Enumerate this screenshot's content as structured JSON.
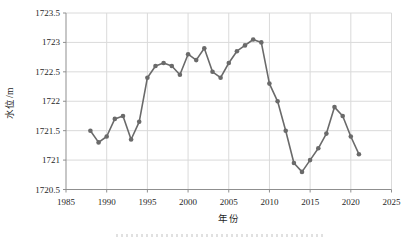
{
  "chart_data": {
    "type": "line",
    "title": "",
    "xlabel": "年份",
    "ylabel": "水位/m",
    "series_name": "年均水位",
    "x": [
      1988,
      1989,
      1990,
      1991,
      1992,
      1993,
      1994,
      1995,
      1996,
      1997,
      1998,
      1999,
      2000,
      2001,
      2002,
      2003,
      2004,
      2005,
      2006,
      2007,
      2008,
      2009,
      2010,
      2011,
      2012,
      2013,
      2014,
      2015,
      2016,
      2017,
      2018,
      2019,
      2020,
      2021
    ],
    "values": [
      1721.5,
      1721.3,
      1721.4,
      1721.7,
      1721.75,
      1721.35,
      1721.65,
      1722.4,
      1722.6,
      1722.65,
      1722.6,
      1722.45,
      1722.8,
      1722.7,
      1722.9,
      1722.5,
      1722.4,
      1722.65,
      1722.85,
      1722.95,
      1723.05,
      1723.0,
      1722.3,
      1722.0,
      1721.5,
      1720.95,
      1720.8,
      1721.0,
      1721.2,
      1721.45,
      1721.9,
      1721.75,
      1721.4,
      1721.1
    ],
    "xlim": [
      1985,
      2025
    ],
    "ylim": [
      1720.5,
      1723.5
    ],
    "x_ticks": [
      1985,
      1990,
      1995,
      2000,
      2005,
      2010,
      2015,
      2020,
      2025
    ],
    "x_tick_labels": [
      "1985",
      "1990",
      "1995",
      "2000",
      "2005",
      "2010",
      "2015",
      "2020",
      "2025"
    ],
    "y_ticks": [
      1720.5,
      1721,
      1721.5,
      1722,
      1722.5,
      1723,
      1723.5
    ],
    "y_tick_labels": [
      "1720.5",
      "1721",
      "1721.5",
      "1722",
      "1722.5",
      "1723",
      "1723.5"
    ],
    "grid": true,
    "legend": false,
    "marker": "circle",
    "colors": {
      "line": "#6a6a6a",
      "marker": "#6a6a6a",
      "grid": "#dadada",
      "axis": "#8f8f8f",
      "tick_label": "#1f1f1f"
    }
  }
}
